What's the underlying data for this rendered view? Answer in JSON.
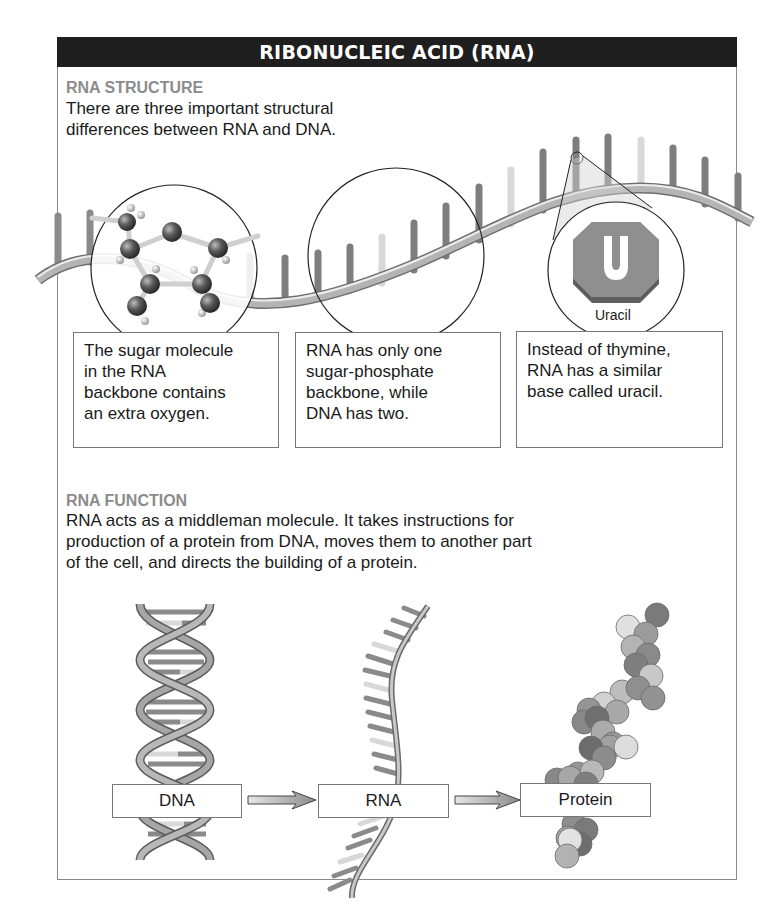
{
  "header": {
    "title": "RIBONUCLEIC ACID (RNA)"
  },
  "structure": {
    "title": "RNA STRUCTURE",
    "intro_lines": [
      "There are three important structural",
      "differences between RNA and DNA."
    ],
    "callouts": [
      {
        "lines": [
          "The sugar molecule",
          "in the RNA",
          "backbone contains",
          "an extra oxygen."
        ],
        "icon": "ribose-sugar-molecule"
      },
      {
        "lines": [
          "RNA has only one",
          "sugar-phosphate",
          "backbone, while",
          "DNA has two."
        ],
        "icon": "single-backbone-strand"
      },
      {
        "lines": [
          "Instead of thymine,",
          "RNA has a similar",
          "base called uracil."
        ],
        "icon": "uracil-base"
      }
    ],
    "uracil_glyph": "U",
    "uracil_label": "Uracil"
  },
  "function": {
    "title": "RNA FUNCTION",
    "lines": [
      "RNA acts as a middleman molecule. It takes instructions for",
      "production of a protein from DNA, moves them to another part",
      "of the cell, and directs the building of a protein."
    ],
    "flow": [
      {
        "label": "DNA",
        "icon": "dna-double-helix"
      },
      {
        "label": "RNA",
        "icon": "rna-single-strand"
      },
      {
        "label": "Protein",
        "icon": "protein-chain"
      }
    ]
  },
  "colors": {
    "header_bg": "#1f1f1f",
    "section_title": "#8c8c8c",
    "base_dark": "#7a7a7a",
    "base_light": "#d6d6d6",
    "backbone": "#9a9a9a"
  }
}
